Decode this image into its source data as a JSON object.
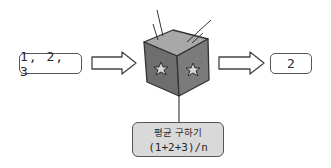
{
  "diagram": {
    "input": {
      "label": "1, 2, 3"
    },
    "process": {
      "shape": "cube",
      "face_icons": [
        "star-icon",
        "star-icon"
      ],
      "caption_line1": "평균 구하기",
      "caption_line2": "(1+2+3)/n"
    },
    "output": {
      "label": "2"
    },
    "arrows": [
      {
        "from": "input",
        "to": "process"
      },
      {
        "from": "process",
        "to": "output"
      }
    ],
    "colors": {
      "cube_front": "#6f6f6f",
      "cube_right": "#7a7a7a",
      "cube_top": "#a9a9a9",
      "label_fill": "#d9d9d9",
      "outline": "#333333"
    }
  }
}
